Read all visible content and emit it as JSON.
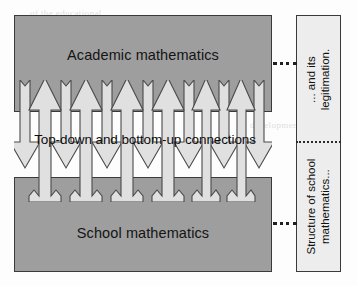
{
  "diagram": {
    "top_block": {
      "label": "Academic mathematics"
    },
    "bottom_block": {
      "label": "School mathematics"
    },
    "middle_caption": "Top-down and bottom-up connections",
    "sidebar": {
      "top_cell": {
        "line1": "... and its",
        "line2": "legitimation."
      },
      "bottom_cell": {
        "line1": "Structure of school",
        "line2": "mathematics..."
      }
    },
    "colors": {
      "block_fill": "#9e9e9e",
      "block_stroke": "#3a3a3a",
      "arrow_fill": "#e0e0e0",
      "arrow_stroke": "#4a4a4a",
      "sidebar_fill": "#ededed",
      "text": "#111111",
      "connector": "#1f1f1f"
    },
    "arrows": {
      "down_count": 7,
      "up_count": 6,
      "down_label": "top-down connection arrow",
      "up_label": "bottom-up connection arrow"
    },
    "ghost_text": [
      "of the educational",
      "in mathematics and",
      "development",
      "to a reconstruction",
      "the concepts"
    ]
  }
}
